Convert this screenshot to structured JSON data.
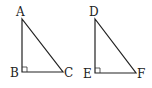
{
  "diagram": {
    "triangles": [
      {
        "name": "ABC",
        "right_angle_at": "B",
        "vertices": [
          {
            "label": "A",
            "x": 22,
            "y": 19
          },
          {
            "label": "B",
            "x": 22,
            "y": 72
          },
          {
            "label": "C",
            "x": 63,
            "y": 72
          }
        ]
      },
      {
        "name": "DEF",
        "right_angle_at": "E",
        "vertices": [
          {
            "label": "D",
            "x": 95,
            "y": 19
          },
          {
            "label": "E",
            "x": 95,
            "y": 73
          },
          {
            "label": "F",
            "x": 136,
            "y": 73
          }
        ]
      }
    ],
    "labels": {
      "A": "A",
      "B": "B",
      "C": "C",
      "D": "D",
      "E": "E",
      "F": "F"
    },
    "stroke_color": "#222222"
  }
}
